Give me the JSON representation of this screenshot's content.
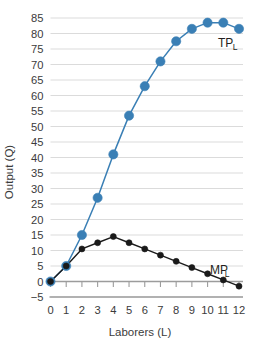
{
  "chart_data": {
    "type": "line",
    "title": "",
    "xlabel": "Laborers (L)",
    "ylabel": "Output (Q)",
    "x": [
      0,
      1,
      2,
      3,
      4,
      5,
      6,
      7,
      8,
      9,
      10,
      11,
      12
    ],
    "xlim": [
      0,
      12
    ],
    "ylim": [
      -5,
      85
    ],
    "xticks": [
      "0",
      "1",
      "2",
      "3",
      "4",
      "5",
      "6",
      "7",
      "8",
      "9",
      "10",
      "11",
      "12"
    ],
    "yticks": [
      "-5",
      "0",
      "5",
      "10",
      "15",
      "20",
      "25",
      "30",
      "35",
      "40",
      "45",
      "50",
      "55",
      "60",
      "65",
      "70",
      "75",
      "80",
      "85"
    ],
    "grid": "horizontal",
    "legend_position": "inline-right",
    "series": [
      {
        "name": "TP_L",
        "label_main": "TP",
        "label_sub": "L",
        "color": "#3a7fb5",
        "marker": "circle",
        "marker_size": 4.6,
        "values": [
          0,
          5,
          15,
          27,
          41,
          53.5,
          63,
          71,
          77.5,
          81.5,
          83.5,
          83.5,
          81.5
        ]
      },
      {
        "name": "MP_L",
        "label_main": "MP",
        "label_sub": "L",
        "color": "#1a1a1a",
        "marker": "circle",
        "marker_size": 3.0,
        "values": [
          0,
          5,
          10.5,
          12.5,
          14.5,
          12.5,
          10.5,
          8.5,
          6.5,
          4.5,
          2.5,
          0.5,
          -1.5
        ]
      }
    ]
  },
  "labels": {
    "tp_main": "TP",
    "tp_sub": "L",
    "mp_main": "MP",
    "mp_sub": "L",
    "x_axis_title": "Laborers (L)",
    "y_axis_title": "Output (Q)"
  },
  "colors": {
    "tp_blue": "#3a7fb5",
    "mp_black": "#1a1a1a",
    "grid": "#d7d7d7",
    "axis": "#9c9c9c",
    "text": "#3b3b3b",
    "background": "#ffffff"
  }
}
